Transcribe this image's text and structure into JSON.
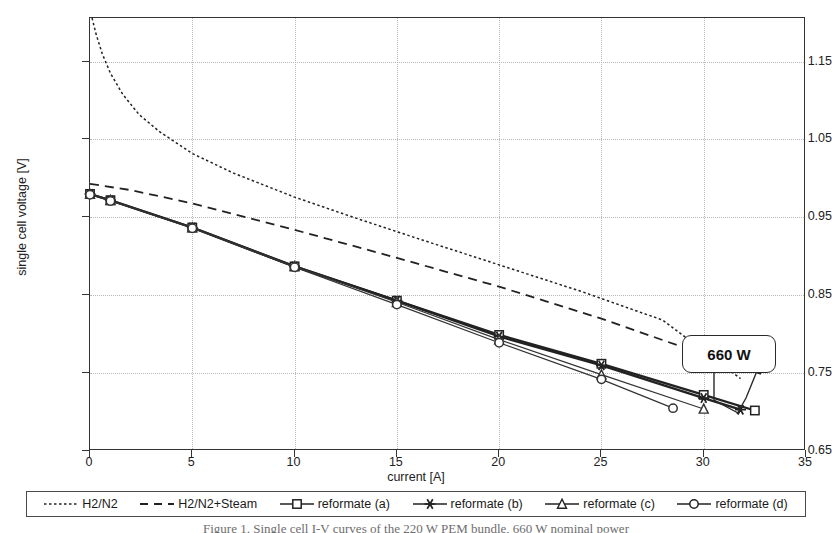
{
  "chart_data": {
    "type": "line",
    "title": "",
    "xlabel": "current [A]",
    "ylabel": "single cell voltage [V]",
    "xlim": [
      0,
      35
    ],
    "ylim": [
      0.65,
      1.206
    ],
    "xticks": [
      0,
      5,
      10,
      15,
      20,
      25,
      30,
      35
    ],
    "yticks": [
      0.65,
      0.75,
      0.85,
      0.95,
      1.05,
      1.15
    ],
    "xtick_labels": [
      "0",
      "5",
      "10",
      "15",
      "20",
      "25",
      "30",
      "35"
    ],
    "ytick_labels": [
      "0.65",
      "0.75",
      "0.85",
      "0.95",
      "1.05",
      "1.15"
    ],
    "grid": true,
    "legend_position": "below-axes",
    "annotations": [
      {
        "text": "660 W",
        "x": 32.0,
        "y": 0.705,
        "style": "rounded-box-callout"
      }
    ],
    "series": [
      {
        "name": "H2/N2",
        "style": "dotted",
        "marker": "none",
        "color": "#222222",
        "x": [
          0.1,
          0.3,
          0.6,
          1.0,
          1.6,
          2.4,
          3.4,
          5.0,
          7.0,
          10.0,
          13.0,
          16.0,
          20.0,
          24.0,
          28.0,
          31.8
        ],
        "y": [
          1.206,
          1.185,
          1.16,
          1.135,
          1.108,
          1.082,
          1.06,
          1.032,
          1.007,
          0.976,
          0.949,
          0.923,
          0.889,
          0.855,
          0.818,
          0.743
        ]
      },
      {
        "name": "H2/N2+Steam",
        "style": "dashed",
        "marker": "none",
        "color": "#222222",
        "x": [
          0.0,
          2.0,
          5.0,
          10.0,
          15.0,
          20.0,
          25.0,
          30.0,
          32.8
        ],
        "y": [
          0.993,
          0.985,
          0.968,
          0.934,
          0.898,
          0.861,
          0.82,
          0.774,
          0.749
        ]
      },
      {
        "name": "reformate (a)",
        "style": "solid-thick",
        "marker": "square",
        "color": "#222222",
        "x": [
          0.0,
          1.0,
          5.0,
          10.0,
          15.0,
          20.0,
          25.0,
          30.0,
          32.5
        ],
        "y": [
          0.98,
          0.972,
          0.937,
          0.887,
          0.843,
          0.799,
          0.762,
          0.722,
          0.702
        ]
      },
      {
        "name": "reformate (b)",
        "style": "solid-thick",
        "marker": "star",
        "color": "#222222",
        "x": [
          0.0,
          1.0,
          5.0,
          10.0,
          15.0,
          20.0,
          25.0,
          30.0,
          31.8
        ],
        "y": [
          0.98,
          0.972,
          0.937,
          0.887,
          0.843,
          0.797,
          0.76,
          0.718,
          0.703
        ]
      },
      {
        "name": "reformate (c)",
        "style": "solid-thin",
        "marker": "triangle",
        "color": "#333333",
        "x": [
          0.0,
          1.0,
          5.0,
          10.0,
          15.0,
          20.0,
          25.0,
          30.0
        ],
        "y": [
          0.98,
          0.972,
          0.937,
          0.887,
          0.841,
          0.793,
          0.748,
          0.704
        ]
      },
      {
        "name": "reformate (d)",
        "style": "solid-thin",
        "marker": "circle",
        "color": "#333333",
        "x": [
          0.0,
          1.0,
          5.0,
          10.0,
          15.0,
          20.0,
          25.0,
          28.5
        ],
        "y": [
          0.979,
          0.971,
          0.936,
          0.886,
          0.838,
          0.789,
          0.742,
          0.705
        ]
      }
    ]
  },
  "axes": {
    "x_title": "current [A]",
    "y_title": "single cell voltage [V]"
  },
  "legend": {
    "items": [
      {
        "label": "H2/N2",
        "marker": "none",
        "style": "dotted"
      },
      {
        "label": "H2/N2+Steam",
        "marker": "none",
        "style": "dashed"
      },
      {
        "label": "reformate (a)",
        "marker": "square",
        "style": "solid"
      },
      {
        "label": "reformate (b)",
        "marker": "star",
        "style": "solid"
      },
      {
        "label": "reformate (c)",
        "marker": "triangle",
        "style": "solid"
      },
      {
        "label": "reformate (d)",
        "marker": "circle",
        "style": "solid"
      }
    ]
  },
  "callout": {
    "label": "660 W"
  },
  "caption": {
    "text": "Figure 1. Single cell I-V curves of the 220 W PEM bundle, 660 W nominal power"
  }
}
